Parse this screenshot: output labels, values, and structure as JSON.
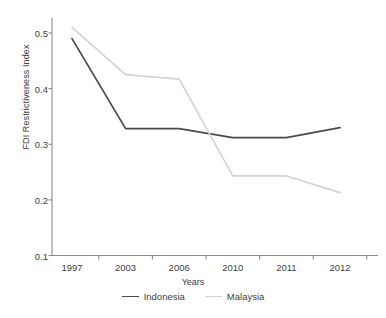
{
  "chart_data": {
    "type": "line",
    "title": "",
    "xlabel": "Years",
    "ylabel": "FDI Restrictiveness Index",
    "categories": [
      "1997",
      "2003",
      "2006",
      "2010",
      "2011",
      "2012"
    ],
    "ylim": [
      0.1,
      0.5
    ],
    "yticks": [
      "0.1",
      "0.2",
      "0.3",
      "0.4",
      "0.5"
    ],
    "ytick_values": [
      0.1,
      0.2,
      0.3,
      0.4,
      0.5
    ],
    "grid": false,
    "legend_position": "bottom-center",
    "series": [
      {
        "name": "Indonesia",
        "color": "#4a4a4a",
        "values": [
          0.49,
          0.328,
          0.328,
          0.312,
          0.312,
          0.33
        ]
      },
      {
        "name": "Malaysia",
        "color": "#d4d4d4",
        "values": [
          0.51,
          0.425,
          0.417,
          0.243,
          0.243,
          0.213
        ]
      }
    ]
  },
  "axis": {
    "spine_color": "#8a8a8a",
    "tick_color": "#8a8a8a"
  }
}
